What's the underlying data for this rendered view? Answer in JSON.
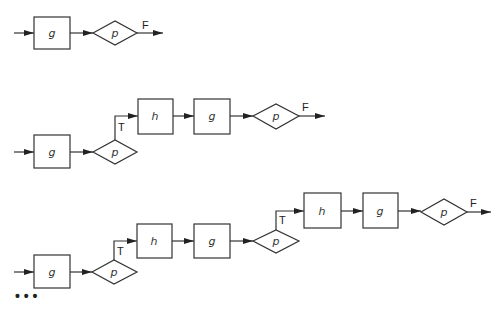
{
  "diagram": {
    "rows": [
      {
        "id": "row-1",
        "nodes": [
          {
            "type": "process",
            "label": "g"
          },
          {
            "type": "decision",
            "label": "p"
          }
        ],
        "exit_label": "F"
      },
      {
        "id": "row-2",
        "nodes": [
          {
            "type": "process",
            "label": "g"
          },
          {
            "type": "decision",
            "label": "p",
            "branch": "T"
          },
          {
            "type": "process",
            "label": "h"
          },
          {
            "type": "process",
            "label": "g"
          },
          {
            "type": "decision",
            "label": "p"
          }
        ],
        "branch_label": "T",
        "exit_label": "F"
      },
      {
        "id": "row-3",
        "nodes": [
          {
            "type": "process",
            "label": "g"
          },
          {
            "type": "decision",
            "label": "p",
            "branch": "T"
          },
          {
            "type": "process",
            "label": "h"
          },
          {
            "type": "process",
            "label": "g"
          },
          {
            "type": "decision",
            "label": "p",
            "branch": "T"
          },
          {
            "type": "process",
            "label": "h"
          },
          {
            "type": "process",
            "label": "g"
          },
          {
            "type": "decision",
            "label": "p"
          }
        ],
        "branch_label": "T",
        "exit_label": "F"
      }
    ],
    "continuation": "..."
  },
  "labels": {
    "g": "g",
    "h": "h",
    "p": "p",
    "T": "T",
    "F": "F",
    "ellipsis": "• • •"
  }
}
